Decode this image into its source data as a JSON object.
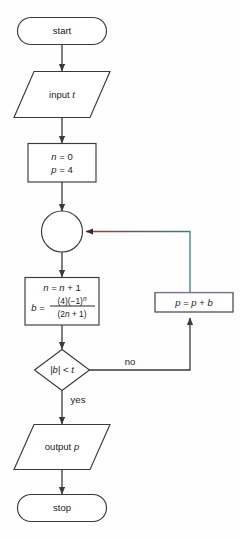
{
  "diagram": {
    "background_color": "#fefefe",
    "line_color": "#3a3a3a",
    "text_color": "#1b1b1b",
    "loopback_color_left": "#9e3b3b",
    "loopback_color_right": "#3c7f80",
    "accent_box_top_color": "#9a7fb0"
  },
  "nodes": {
    "start": {
      "label": "start",
      "shape": "terminator"
    },
    "input": {
      "label": "input",
      "variable": "t",
      "shape": "parallelogram"
    },
    "init": {
      "line1_lhs": "n",
      "line1_op": "=",
      "line1_rhs": "0",
      "line2_lhs": "p",
      "line2_op": "=",
      "line2_rhs": "4",
      "shape": "process"
    },
    "connector": {
      "label": "",
      "shape": "circle"
    },
    "update": {
      "line1": "n = n + 1",
      "line1_lhs": "n",
      "line1_rhs": "n + 1",
      "formula_lhs": "b",
      "formula_numerator": "(4)(−1)",
      "formula_numerator_exp": "n",
      "formula_denominator": "(2n + 1)",
      "shape": "process"
    },
    "decision": {
      "condition": "|b| < t",
      "condition_abs_open": "|",
      "condition_var": "b",
      "condition_abs_close": "|",
      "condition_op": "<",
      "condition_rhs": "t",
      "shape": "diamond",
      "branch_yes": "yes",
      "branch_no": "no"
    },
    "accumulate": {
      "label": "p = p + b",
      "lhs": "p",
      "rhs": "p + b",
      "shape": "process"
    },
    "output": {
      "label": "output",
      "variable": "p",
      "shape": "parallelogram"
    },
    "stop": {
      "label": "stop",
      "shape": "terminator"
    }
  }
}
